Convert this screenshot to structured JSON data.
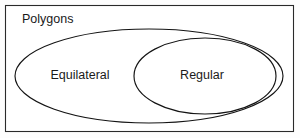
{
  "diagram": {
    "type": "euler-diagram",
    "universe": {
      "label": "Polygons",
      "shape": "rectangle",
      "label_x": 22,
      "label_y": 20,
      "x": 5.5,
      "y": 5.5,
      "width": 288,
      "height": 126
    },
    "sets": [
      {
        "id": "equilateral",
        "label": "Equilateral",
        "shape": "ellipse",
        "cx": 149,
        "cy": 76,
        "rx": 134,
        "ry": 47,
        "label_x": 80,
        "label_y": 76
      },
      {
        "id": "regular",
        "label": "Regular",
        "shape": "ellipse",
        "cx": 205,
        "cy": 76,
        "rx": 71,
        "ry": 38,
        "label_x": 202,
        "label_y": 76
      }
    ],
    "relationship": "Regular is a proper subset of Equilateral, which is a proper subset of Polygons",
    "colors": {
      "background": "#fdfdfd",
      "frame_fill": "#ffffff",
      "frame_stroke": "#2a2a2a",
      "ellipse_stroke": "#141414",
      "text": "#1a1a1a"
    }
  }
}
